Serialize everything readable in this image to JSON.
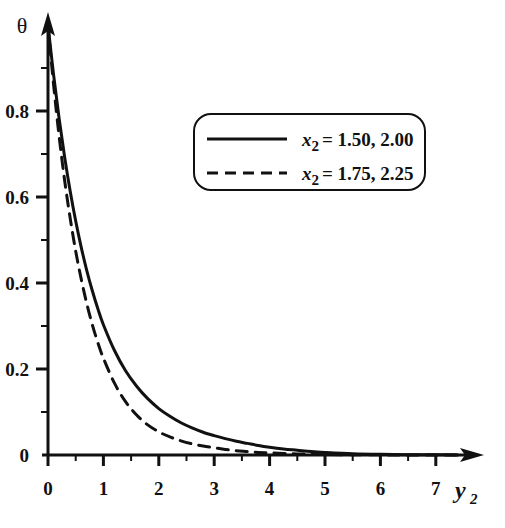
{
  "figure": {
    "background": "#ffffff",
    "ink_color": "#111111"
  },
  "chart_data": {
    "type": "line",
    "title": "",
    "subtitle": "",
    "xlabel": "y_2",
    "ylabel": "theta",
    "xlabel_display": "y",
    "xlabel_subscript": "2",
    "ylabel_display": "θ",
    "xlim": [
      0,
      7.6
    ],
    "ylim": [
      0,
      1.0
    ],
    "xticks": [
      0,
      1,
      2,
      3,
      4,
      5,
      6,
      7
    ],
    "xtick_labels": [
      "0",
      "1",
      "2",
      "3",
      "4",
      "5",
      "6",
      "7"
    ],
    "yticks": [
      0,
      0.2,
      0.4,
      0.6,
      0.8
    ],
    "ytick_labels": [
      "0",
      "0.2",
      "0.4",
      "0.6",
      "0.8"
    ],
    "minor_ticks": true,
    "grid": false,
    "legend_position": "upper-right-inside",
    "axis_style": "arrow-tipped",
    "series": [
      {
        "name": "x_2 = 1.50, 2.00",
        "label_var": "x",
        "label_sub": "2",
        "label_values": "= 1.50, 2.00",
        "style": "solid",
        "color": "#111111",
        "x": [
          0,
          0.1,
          0.2,
          0.3,
          0.4,
          0.5,
          0.6,
          0.7,
          0.8,
          0.9,
          1.0,
          1.2,
          1.4,
          1.6,
          1.8,
          2.0,
          2.2,
          2.4,
          2.6,
          2.8,
          3.0,
          3.2,
          3.4,
          3.6,
          3.8,
          4.0,
          4.25,
          4.5,
          4.75,
          5.0,
          5.5,
          6.0,
          6.5,
          7.0,
          7.4
        ],
        "y": [
          1.0,
          0.885,
          0.783,
          0.693,
          0.614,
          0.544,
          0.483,
          0.429,
          0.382,
          0.34,
          0.303,
          0.243,
          0.196,
          0.16,
          0.131,
          0.108,
          0.09,
          0.075,
          0.063,
          0.053,
          0.045,
          0.038,
          0.032,
          0.027,
          0.022,
          0.018,
          0.014,
          0.011,
          0.008,
          0.006,
          0.003,
          0.0015,
          0.0008,
          0.0004,
          0.0002
        ]
      },
      {
        "name": "x_2 = 1.75, 2.25",
        "label_var": "x",
        "label_sub": "2",
        "label_values": "= 1.75, 2.25",
        "style": "dashed",
        "color": "#111111",
        "x": [
          0,
          0.1,
          0.2,
          0.3,
          0.4,
          0.5,
          0.6,
          0.7,
          0.8,
          0.9,
          1.0,
          1.2,
          1.4,
          1.6,
          1.8,
          2.0,
          2.2,
          2.4,
          2.6,
          2.8,
          3.0,
          3.2,
          3.4,
          3.6,
          3.8,
          4.0,
          4.25,
          4.5,
          4.75,
          5.0,
          5.5,
          6.0,
          6.5,
          7.0,
          7.4
        ],
        "y": [
          1.0,
          0.862,
          0.742,
          0.639,
          0.551,
          0.474,
          0.409,
          0.352,
          0.303,
          0.261,
          0.225,
          0.167,
          0.124,
          0.093,
          0.07,
          0.054,
          0.042,
          0.033,
          0.026,
          0.021,
          0.017,
          0.013,
          0.01,
          0.008,
          0.006,
          0.005,
          0.0035,
          0.0025,
          0.0017,
          0.0012,
          0.0006,
          0.0003,
          0.00015,
          8e-05,
          4e-05
        ]
      }
    ]
  },
  "legend": {
    "entries": [
      {
        "style": "solid",
        "var": "x",
        "sub": "2",
        "eq": "= 1.50, 2.00"
      },
      {
        "style": "dashed",
        "var": "x",
        "sub": "2",
        "eq": "= 1.75, 2.25"
      }
    ]
  },
  "caption": {
    "text": ""
  }
}
